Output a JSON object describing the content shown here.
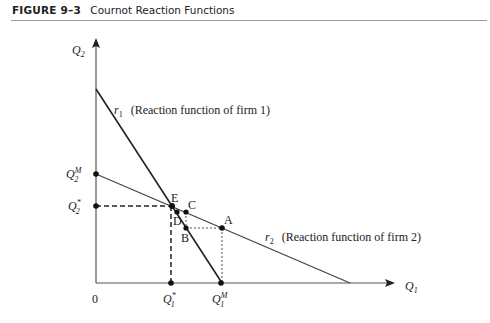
{
  "figure": {
    "number": "FIGURE 9–3",
    "title": "Cournot Reaction Functions"
  },
  "axes": {
    "y_label": "Q",
    "y_sub": "2",
    "x_label": "Q",
    "x_sub": "1",
    "origin": "0"
  },
  "curves": {
    "r1": {
      "name": "r",
      "sub": "1",
      "desc": "(Reaction function of firm 1)"
    },
    "r2": {
      "name": "r",
      "sub": "2",
      "desc": "(Reaction function of firm 2)"
    }
  },
  "points": {
    "A": "A",
    "B": "B",
    "C": "C",
    "D": "D",
    "E": "E"
  },
  "ticks": {
    "q2m": {
      "base": "Q",
      "sup": "M",
      "sub": "2"
    },
    "q2star": {
      "base": "Q",
      "sup": "*",
      "sub": "2"
    },
    "q1star": {
      "base": "Q",
      "sup": "*",
      "sub": "1"
    },
    "q1m": {
      "base": "Q",
      "sup": "M",
      "sub": "1"
    }
  },
  "colors": {
    "line": "#222222",
    "dash": "#222222"
  }
}
